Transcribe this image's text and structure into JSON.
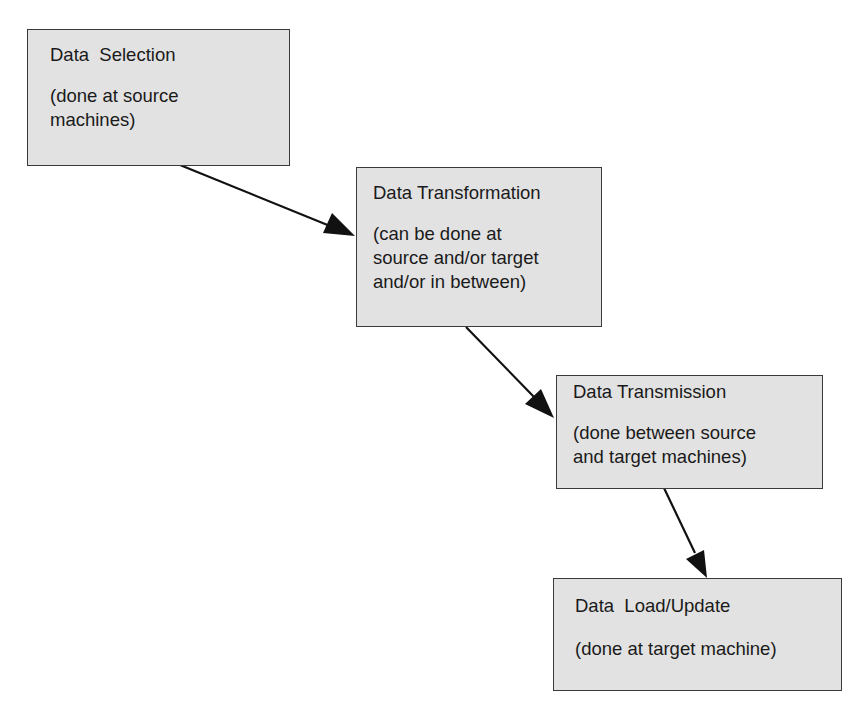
{
  "diagram": {
    "type": "flowchart",
    "steps": [
      {
        "title": "Data  Selection",
        "desc": "(done at source\nmachines)"
      },
      {
        "title": "Data Transformation",
        "desc": "(can be done at\nsource and/or target\nand/or in between)"
      },
      {
        "title": "Data Transmission",
        "desc": "(done between source\nand target machines)"
      },
      {
        "title": "Data  Load/Update",
        "desc": "(done at target machine)"
      }
    ],
    "edges": [
      {
        "from": "Data Selection",
        "to": "Data Transformation"
      },
      {
        "from": "Data Transformation",
        "to": "Data Transmission"
      },
      {
        "from": "Data Transmission",
        "to": "Data Load/Update"
      }
    ],
    "colors": {
      "box_fill": "#e2e2e2",
      "border": "#3a3a3a",
      "arrow": "#111111"
    }
  }
}
